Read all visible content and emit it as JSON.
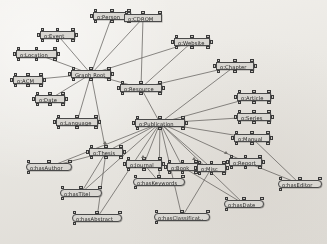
{
  "app": {
    "title": "Ontology Graph Editor",
    "canvas_background": "#eceae6",
    "node_fill": "#d9d7d2",
    "node_border": "#4a4a4a",
    "edge_color": "#5a5854"
  },
  "graph": {
    "type": "node-link-diagram",
    "node_label_prefix": "o:",
    "nodes": [
      {
        "id": "person",
        "label": "o:Person",
        "x": 93,
        "y": 12,
        "w": 38,
        "shape": "rect",
        "handles": "full"
      },
      {
        "id": "cdrom",
        "label": "o:CDROM",
        "x": 124,
        "y": 14,
        "w": 38,
        "shape": "rect",
        "handles": "top"
      },
      {
        "id": "event",
        "label": "o:Event",
        "x": 40,
        "y": 31,
        "w": 35,
        "shape": "rect",
        "handles": "full"
      },
      {
        "id": "website",
        "label": "o:Website",
        "x": 174,
        "y": 38,
        "w": 36,
        "shape": "rect",
        "handles": "full"
      },
      {
        "id": "location",
        "label": "o:Location",
        "x": 16,
        "y": 50,
        "w": 41,
        "shape": "rect",
        "handles": "full"
      },
      {
        "id": "graphroot",
        "label": "Graph Root",
        "x": 71,
        "y": 70,
        "w": 40,
        "shape": "rect",
        "handles": "full"
      },
      {
        "id": "chapter",
        "label": "o:Chapter",
        "x": 216,
        "y": 62,
        "w": 38,
        "shape": "rect",
        "handles": "full"
      },
      {
        "id": "acm",
        "label": "o:ACM",
        "x": 13,
        "y": 76,
        "w": 30,
        "shape": "rect",
        "handles": "full"
      },
      {
        "id": "resource",
        "label": "o:Resource",
        "x": 120,
        "y": 84,
        "w": 42,
        "shape": "rect",
        "handles": "full"
      },
      {
        "id": "article",
        "label": "o:Article",
        "x": 237,
        "y": 93,
        "w": 34,
        "shape": "rect",
        "handles": "full"
      },
      {
        "id": "date",
        "label": "o:Date",
        "x": 35,
        "y": 95,
        "w": 30,
        "shape": "rect",
        "handles": "full"
      },
      {
        "id": "series",
        "label": "o:Series",
        "x": 237,
        "y": 113,
        "w": 34,
        "shape": "rect",
        "handles": "full"
      },
      {
        "id": "language",
        "label": "o:Language",
        "x": 56,
        "y": 118,
        "w": 42,
        "shape": "rect",
        "handles": "full"
      },
      {
        "id": "publication",
        "label": "o:Publication",
        "x": 135,
        "y": 119,
        "w": 50,
        "shape": "rect",
        "handles": "full"
      },
      {
        "id": "manual",
        "label": "o:Manual",
        "x": 234,
        "y": 134,
        "w": 36,
        "shape": "rect",
        "handles": "full"
      },
      {
        "id": "thesis",
        "label": "o:Thesis",
        "x": 89,
        "y": 148,
        "w": 34,
        "shape": "rect",
        "handles": "full"
      },
      {
        "id": "journal",
        "label": "o:Journal",
        "x": 126,
        "y": 160,
        "w": 36,
        "shape": "rect",
        "handles": "full"
      },
      {
        "id": "book",
        "label": "o:Book",
        "x": 167,
        "y": 163,
        "w": 31,
        "shape": "rect",
        "handles": "full"
      },
      {
        "id": "misc",
        "label": "o:Misc",
        "x": 197,
        "y": 164,
        "w": 29,
        "shape": "rect",
        "handles": "full"
      },
      {
        "id": "report",
        "label": "o:Report",
        "x": 229,
        "y": 158,
        "w": 33,
        "shape": "rect",
        "handles": "full"
      },
      {
        "id": "hasauthor",
        "label": "o:hasAuthor",
        "x": 26,
        "y": 163,
        "w": 46,
        "shape": "rounded",
        "handles": "half"
      },
      {
        "id": "haskeywords",
        "label": "o:hasKeywords",
        "x": 133,
        "y": 178,
        "w": 52,
        "shape": "rounded",
        "handles": "half"
      },
      {
        "id": "haseditor",
        "label": "o:hasEditor",
        "x": 278,
        "y": 180,
        "w": 44,
        "shape": "rounded",
        "handles": "half"
      },
      {
        "id": "hastitel",
        "label": "o:hasTitel",
        "x": 60,
        "y": 189,
        "w": 42,
        "shape": "rounded",
        "handles": "half"
      },
      {
        "id": "hasdate",
        "label": "o:hasDate",
        "x": 224,
        "y": 200,
        "w": 40,
        "shape": "rounded",
        "handles": "half"
      },
      {
        "id": "hasabstract",
        "label": "o:hasAbstract",
        "x": 72,
        "y": 214,
        "w": 50,
        "shape": "rounded",
        "handles": "half"
      },
      {
        "id": "hasclassificat",
        "label": "o:hasClassificat..",
        "x": 154,
        "y": 213,
        "w": 56,
        "shape": "rounded",
        "handles": "half"
      }
    ],
    "edges": [
      {
        "from": "graphroot",
        "to": "person"
      },
      {
        "from": "graphroot",
        "to": "event"
      },
      {
        "from": "graphroot",
        "to": "location"
      },
      {
        "from": "graphroot",
        "to": "acm"
      },
      {
        "from": "graphroot",
        "to": "date"
      },
      {
        "from": "graphroot",
        "to": "language"
      },
      {
        "from": "graphroot",
        "to": "resource"
      },
      {
        "from": "graphroot",
        "to": "cdrom"
      },
      {
        "from": "graphroot",
        "to": "website"
      },
      {
        "from": "graphroot",
        "to": "thesis"
      },
      {
        "from": "resource",
        "to": "cdrom"
      },
      {
        "from": "resource",
        "to": "website"
      },
      {
        "from": "resource",
        "to": "chapter"
      },
      {
        "from": "resource",
        "to": "publication"
      },
      {
        "from": "publication",
        "to": "chapter"
      },
      {
        "from": "publication",
        "to": "article"
      },
      {
        "from": "publication",
        "to": "series"
      },
      {
        "from": "publication",
        "to": "manual"
      },
      {
        "from": "publication",
        "to": "report"
      },
      {
        "from": "publication",
        "to": "misc"
      },
      {
        "from": "publication",
        "to": "book"
      },
      {
        "from": "publication",
        "to": "journal"
      },
      {
        "from": "publication",
        "to": "thesis"
      },
      {
        "from": "publication",
        "to": "haskeywords"
      },
      {
        "from": "publication",
        "to": "hasclassificat"
      },
      {
        "from": "publication",
        "to": "hasdate"
      },
      {
        "from": "publication",
        "to": "hastitel"
      },
      {
        "from": "publication",
        "to": "hasabstract"
      },
      {
        "from": "publication",
        "to": "hasauthor"
      },
      {
        "from": "thesis",
        "to": "hasauthor"
      },
      {
        "from": "thesis",
        "to": "hastitel"
      },
      {
        "from": "thesis",
        "to": "hasabstract"
      },
      {
        "from": "report",
        "to": "haseditor"
      },
      {
        "from": "manual",
        "to": "haseditor"
      },
      {
        "from": "journal",
        "to": "haskeywords"
      },
      {
        "from": "misc",
        "to": "hasclassificat"
      },
      {
        "from": "book",
        "to": "hasdate"
      }
    ]
  }
}
